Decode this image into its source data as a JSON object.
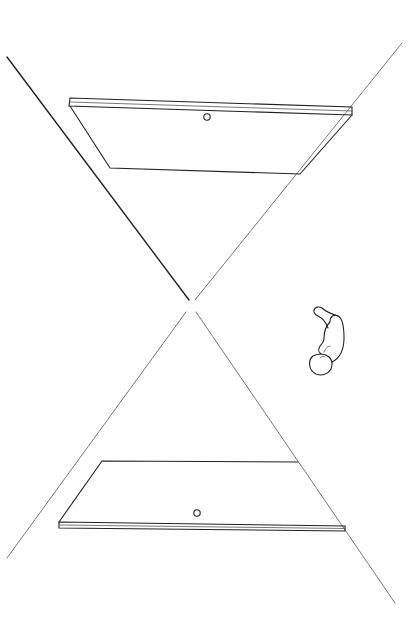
{
  "illustration": {
    "title": "",
    "description": "Line drawing: two planes (one above, one below) bounded by crossing lines forming an hourglass/X shape, with a small embryo figure to the right of the crossing point",
    "elements": [
      {
        "name": "upper-plate",
        "feature": "small circle marker"
      },
      {
        "name": "lower-plate",
        "feature": "small circle marker"
      },
      {
        "name": "crossing-lines",
        "count": 4
      },
      {
        "name": "embryo-figure"
      }
    ],
    "colors": {
      "ink": "#222222",
      "background": "#ffffff"
    }
  }
}
